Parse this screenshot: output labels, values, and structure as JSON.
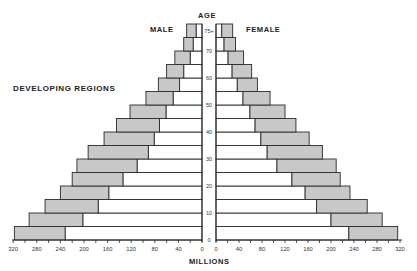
{
  "labels": {
    "age": "AGE",
    "male": "MALE",
    "female": "FEMALE",
    "region": "DEVELOPING REGIONS",
    "xaxis": "MILLIONS"
  },
  "colors": {
    "shaded": "#c8c8c8",
    "white": "#ffffff",
    "stroke": "#2a2a2a"
  },
  "chart_data": {
    "type": "bar",
    "subtype": "population-pyramid",
    "title": "DEVELOPING REGIONS",
    "xlabel": "MILLIONS",
    "ylabel": "AGE",
    "x_ticks_left": [
      320,
      280,
      240,
      200,
      160,
      120,
      80,
      40,
      0
    ],
    "x_ticks_right": [
      0,
      40,
      80,
      120,
      160,
      200,
      240,
      280,
      320
    ],
    "y_ticks": [
      "0",
      "10",
      "20",
      "30",
      "40",
      "50",
      "60",
      "70",
      "75+"
    ],
    "xlim": [
      0,
      320
    ],
    "categories": [
      "0-4",
      "5-9",
      "10-14",
      "15-19",
      "20-24",
      "25-29",
      "30-34",
      "35-39",
      "40-44",
      "45-49",
      "50-54",
      "55-59",
      "60-64",
      "65-69",
      "70-74",
      "75+"
    ],
    "series": [
      {
        "name": "Male (inner, white)",
        "values": [
          232,
          202,
          176,
          158,
          134,
          110,
          91,
          81,
          72,
          61,
          49,
          38,
          31,
          20,
          15,
          10
        ]
      },
      {
        "name": "Male (outer total incl. shaded)",
        "values": [
          318,
          293,
          266,
          240,
          220,
          212,
          193,
          166,
          145,
          122,
          95,
          74,
          60,
          46,
          31,
          26
        ]
      },
      {
        "name": "Female (inner, white)",
        "values": [
          231,
          200,
          175,
          155,
          132,
          106,
          89,
          78,
          68,
          59,
          47,
          37,
          28,
          21,
          14,
          10
        ]
      },
      {
        "name": "Female (outer total incl. shaded)",
        "values": [
          316,
          289,
          263,
          233,
          216,
          209,
          185,
          162,
          139,
          120,
          94,
          72,
          62,
          48,
          34,
          29
        ]
      }
    ],
    "legend": null,
    "grid": false
  }
}
